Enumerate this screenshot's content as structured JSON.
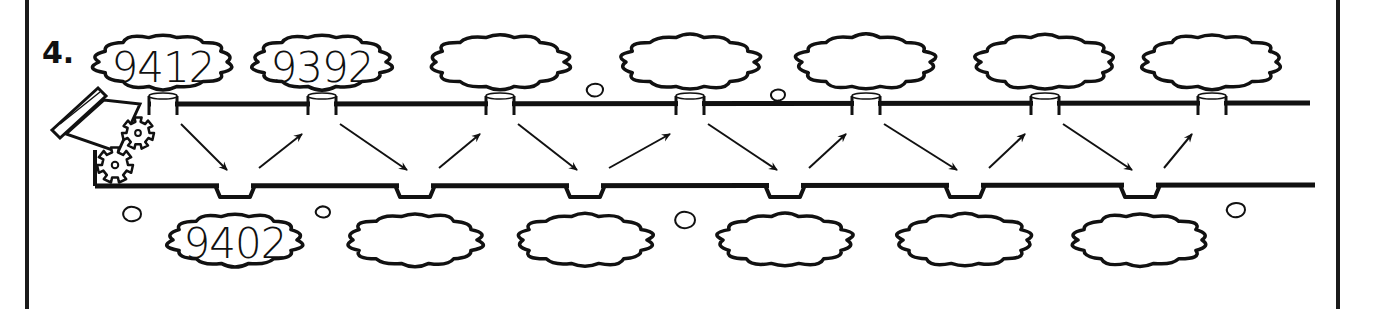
{
  "problem": {
    "number_label": "4.",
    "description": "Number pipeline: values alternate between top and bottom clouds along a pipe"
  },
  "colors": {
    "ink": "#111111",
    "paper": "#ffffff",
    "frame": "#1a1a1a"
  },
  "top_clouds": [
    {
      "value": "9412",
      "cx": 163,
      "filled": true
    },
    {
      "value": "9392",
      "cx": 322,
      "filled": true
    },
    {
      "value": "",
      "cx": 500,
      "filled": false
    },
    {
      "value": "",
      "cx": 690,
      "filled": false
    },
    {
      "value": "",
      "cx": 866,
      "filled": false
    },
    {
      "value": "",
      "cx": 1045,
      "filled": false
    },
    {
      "value": "",
      "cx": 1212,
      "filled": false
    }
  ],
  "bottom_clouds": [
    {
      "value": "9402",
      "cx": 235,
      "filled": true
    },
    {
      "value": "",
      "cx": 415,
      "filled": false
    },
    {
      "value": "",
      "cx": 585,
      "filled": false
    },
    {
      "value": "",
      "cx": 785,
      "filled": false
    },
    {
      "value": "",
      "cx": 965,
      "filled": false
    },
    {
      "value": "",
      "cx": 1140,
      "filled": false
    }
  ],
  "arrows": {
    "count": 12,
    "pattern": "alternating down-right then up-right"
  },
  "icons": {
    "cannon": "cannon-icon",
    "gears": "gear-icon",
    "puffs": "puff-icon"
  }
}
